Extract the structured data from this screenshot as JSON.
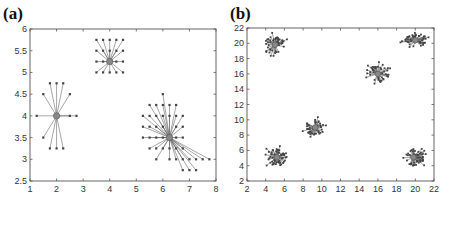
{
  "figure": {
    "panel_labels": [
      "(a)",
      "(b)"
    ]
  },
  "chart_data": [
    {
      "type": "scatter",
      "panel": "(a)",
      "title": "",
      "xlabel": "",
      "ylabel": "",
      "xlim": [
        1,
        8
      ],
      "ylim": [
        2.5,
        6
      ],
      "xticks": [
        1,
        2,
        3,
        4,
        5,
        6,
        7,
        8
      ],
      "yticks": [
        2.5,
        3,
        3.5,
        4,
        4.5,
        5,
        5.5,
        6
      ],
      "ytick_labels": [
        "2.5",
        "3",
        "3.5",
        "4",
        "4.5",
        "5",
        "5.5",
        "6"
      ],
      "grid": false,
      "legend": null,
      "frame_px": {
        "left": 30,
        "right": 216,
        "top": 29,
        "bottom": 181
      },
      "clusters": [
        {
          "center": [
            2,
            4
          ],
          "points": [
            [
              1.25,
              4
            ],
            [
              2.5,
              4
            ],
            [
              2.75,
              4
            ],
            [
              1.5,
              4.5
            ],
            [
              1.75,
              4.75
            ],
            [
              2,
              4.75
            ],
            [
              2.25,
              4.75
            ],
            [
              2.5,
              4.5
            ],
            [
              1.5,
              3.5
            ],
            [
              1.75,
              3.25
            ],
            [
              2,
              3.25
            ],
            [
              2.25,
              3.25
            ]
          ]
        },
        {
          "center": [
            4,
            5.25
          ],
          "points": [
            [
              3.5,
              5.75
            ],
            [
              3.75,
              5.75
            ],
            [
              4,
              5.75
            ],
            [
              4.25,
              5.75
            ],
            [
              4.5,
              5.75
            ],
            [
              3.5,
              5.5
            ],
            [
              3.75,
              5.5
            ],
            [
              4,
              5.5
            ],
            [
              4.25,
              5.5
            ],
            [
              4.5,
              5.5
            ],
            [
              3.5,
              5.25
            ],
            [
              3.75,
              5.25
            ],
            [
              4.25,
              5.25
            ],
            [
              4.5,
              5.25
            ],
            [
              3.5,
              5
            ],
            [
              3.75,
              5
            ],
            [
              4,
              5
            ],
            [
              4.25,
              5
            ],
            [
              4.5,
              5
            ]
          ]
        },
        {
          "center": [
            6.25,
            3.5
          ],
          "points": [
            [
              6,
              4.5
            ],
            [
              5.5,
              4.25
            ],
            [
              5.75,
              4.25
            ],
            [
              6,
              4.25
            ],
            [
              6.25,
              4.25
            ],
            [
              6.5,
              4.25
            ],
            [
              5.25,
              4
            ],
            [
              5.5,
              4
            ],
            [
              5.75,
              4
            ],
            [
              6,
              4
            ],
            [
              6.25,
              4
            ],
            [
              6.5,
              4
            ],
            [
              6.75,
              4
            ],
            [
              5.25,
              3.75
            ],
            [
              5.5,
              3.75
            ],
            [
              5.75,
              3.75
            ],
            [
              6,
              3.75
            ],
            [
              6.5,
              3.75
            ],
            [
              6.75,
              3.75
            ],
            [
              5.25,
              3.5
            ],
            [
              5.5,
              3.5
            ],
            [
              5.75,
              3.5
            ],
            [
              6,
              3.5
            ],
            [
              6.5,
              3.5
            ],
            [
              6.75,
              3.5
            ],
            [
              5.5,
              3.25
            ],
            [
              5.75,
              3.25
            ],
            [
              6,
              3.25
            ],
            [
              6.25,
              3.25
            ],
            [
              6.5,
              3.25
            ],
            [
              6.75,
              3.25
            ],
            [
              5.75,
              3
            ],
            [
              6.25,
              3
            ],
            [
              6.5,
              3
            ],
            [
              6.75,
              3
            ],
            [
              7,
              3
            ],
            [
              7.25,
              3
            ],
            [
              7.5,
              3
            ],
            [
              7.75,
              3
            ],
            [
              6.75,
              2.75
            ],
            [
              7,
              2.75
            ],
            [
              7.25,
              2.75
            ]
          ]
        }
      ]
    },
    {
      "type": "scatter",
      "panel": "(b)",
      "title": "",
      "xlabel": "",
      "ylabel": "",
      "xlim": [
        2,
        22
      ],
      "ylim": [
        2,
        22
      ],
      "xticks": [
        2,
        4,
        6,
        8,
        10,
        12,
        14,
        16,
        18,
        20,
        22
      ],
      "yticks": [
        2,
        4,
        6,
        8,
        10,
        12,
        14,
        16,
        18,
        20,
        22
      ],
      "grid": false,
      "legend": null,
      "frame_px": {
        "left": 247,
        "right": 434,
        "top": 28,
        "bottom": 181
      },
      "clusters": [
        {
          "center": [
            5,
            19.8
          ],
          "spread": 1.1,
          "n": 45,
          "seed": 11
        },
        {
          "center": [
            20,
            20.4
          ],
          "spread": 1.1,
          "n": 50,
          "seed": 23
        },
        {
          "center": [
            16,
            16
          ],
          "spread": 1.1,
          "n": 45,
          "seed": 37
        },
        {
          "center": [
            9.3,
            9
          ],
          "spread": 1.0,
          "n": 45,
          "seed": 41
        },
        {
          "center": [
            5.2,
            5.1
          ],
          "spread": 1.1,
          "n": 55,
          "seed": 53
        },
        {
          "center": [
            19.8,
            5.1
          ],
          "spread": 1.1,
          "n": 50,
          "seed": 67
        }
      ]
    }
  ]
}
